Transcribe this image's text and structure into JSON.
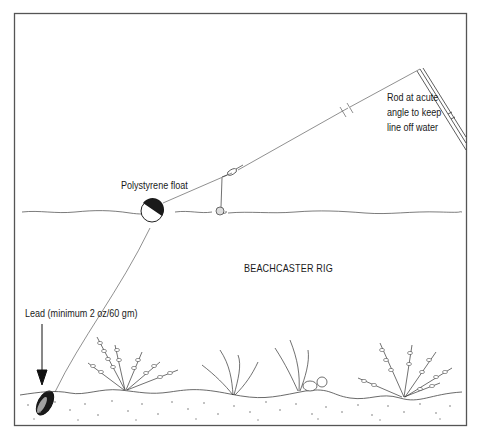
{
  "diagram": {
    "title": "BEACHCASTER RIG",
    "labels": {
      "float": "Polystyrene float",
      "lead": "Lead (minimum 2 oz/60 gm)",
      "rod_line1": "Rod at acute",
      "rod_line2": "angle to keep",
      "rod_line3": "line off water"
    },
    "colors": {
      "ink": "#1a1a1a",
      "frame": "#555555",
      "background": "#ffffff"
    },
    "components": [
      "rod",
      "fishing line",
      "polystyrene float",
      "swivel",
      "baited hook",
      "lead weight",
      "water surface",
      "sea bed",
      "seaweed",
      "pebbles"
    ]
  }
}
